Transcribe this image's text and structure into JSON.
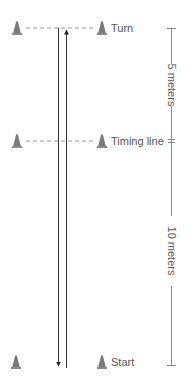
{
  "diagram": {
    "colors": {
      "cone": "#7a7a7a",
      "cone_base": "#9a9a9a",
      "dashed_line": "#9a9a9a",
      "path_line": "#333333",
      "scale_line": "#8a8a8a",
      "text": "#555555",
      "background": "#ffffff"
    },
    "markers": [
      {
        "id": "turn",
        "label": "Turn",
        "y": 28
      },
      {
        "id": "timing",
        "label": "Timing line",
        "y": 141
      },
      {
        "id": "start",
        "label": "Start",
        "y": 361
      }
    ],
    "scale": {
      "segments": [
        {
          "label": "5 meters",
          "from": "turn",
          "to": "timing"
        },
        {
          "label": "10 meters",
          "from": "timing",
          "to": "start"
        }
      ]
    },
    "path": {
      "outbound": "up",
      "return": "down"
    }
  }
}
